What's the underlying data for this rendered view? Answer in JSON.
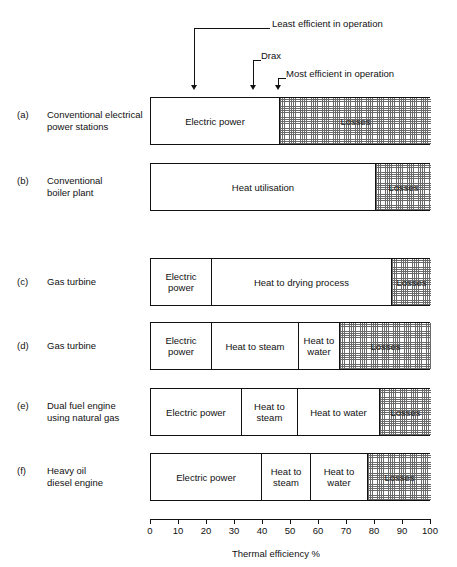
{
  "figure": {
    "axis": {
      "title": "Thermal efficiency %",
      "min": 0,
      "max": 100,
      "tick_step": 10,
      "tick_labels": [
        "0",
        "10",
        "20",
        "30",
        "40",
        "50",
        "60",
        "70",
        "80",
        "90",
        "100"
      ]
    },
    "annotations": [
      {
        "id": "least-efficient",
        "label": "Least efficient in operation",
        "value": 16
      },
      {
        "id": "drax",
        "label": "Drax",
        "value": 37
      },
      {
        "id": "most-efficient",
        "label": "Most efficient in operation",
        "value": 45.7
      }
    ],
    "rows": [
      {
        "letter": "(a)",
        "name_lines": [
          "Conventional electrical",
          "power stations"
        ],
        "segments": [
          {
            "label": "Electric power",
            "start": 0,
            "end": 45.7,
            "style": "plain"
          },
          {
            "label": "Losses",
            "start": 45.7,
            "end": 100,
            "style": "hatch"
          }
        ]
      },
      {
        "letter": "(b)",
        "name_lines": [
          "Conventional",
          "boiler plant"
        ],
        "segments": [
          {
            "label": "Heat utilisation",
            "start": 0,
            "end": 80,
            "style": "plain"
          },
          {
            "label": "Losses",
            "start": 80,
            "end": 100,
            "style": "hatch"
          }
        ]
      },
      {
        "letter": "(c)",
        "name_lines": [
          "Gas turbine"
        ],
        "segments": [
          {
            "label": "Electric power",
            "start": 0,
            "end": 21.4,
            "style": "plain"
          },
          {
            "label": "Heat to drying process",
            "start": 21.4,
            "end": 85.7,
            "style": "plain"
          },
          {
            "label": "Losses",
            "start": 85.7,
            "end": 100,
            "style": "hatch"
          }
        ]
      },
      {
        "letter": "(d)",
        "name_lines": [
          "Gas turbine"
        ],
        "segments": [
          {
            "label": "Electric power",
            "start": 0,
            "end": 21.4,
            "style": "plain"
          },
          {
            "label": "Heat to steam",
            "start": 21.4,
            "end": 52.5,
            "style": "plain"
          },
          {
            "label": "Heat to water",
            "start": 52.5,
            "end": 67.1,
            "style": "plain"
          },
          {
            "label": "Losses",
            "start": 67.1,
            "end": 100,
            "style": "hatch"
          }
        ]
      },
      {
        "letter": "(e)",
        "name_lines": [
          "Dual fuel engine",
          "using natural gas"
        ],
        "segments": [
          {
            "label": "Electric power",
            "start": 0,
            "end": 32.1,
            "style": "plain"
          },
          {
            "label": "Heat to steam",
            "start": 32.1,
            "end": 52.1,
            "style": "plain"
          },
          {
            "label": "Heat to water",
            "start": 52.1,
            "end": 81.4,
            "style": "plain"
          },
          {
            "label": "Losses",
            "start": 81.4,
            "end": 100,
            "style": "hatch"
          }
        ]
      },
      {
        "letter": "(f)",
        "name_lines": [
          "Heavy oil",
          "diesel engine"
        ],
        "segments": [
          {
            "label": "Electric power",
            "start": 0,
            "end": 39.3,
            "style": "plain"
          },
          {
            "label": "Heat to steam",
            "start": 39.3,
            "end": 56.8,
            "style": "plain"
          },
          {
            "label": "Heat to water",
            "start": 56.8,
            "end": 77.1,
            "style": "plain"
          },
          {
            "label": "Losses",
            "start": 77.1,
            "end": 100,
            "style": "hatch"
          }
        ]
      }
    ]
  },
  "chart_data": {
    "type": "bar",
    "title": "",
    "xlabel": "Thermal efficiency %",
    "ylabel": "",
    "xlim": [
      0,
      100
    ],
    "grid": false,
    "legend": "none",
    "orientation": "horizontal-stacked",
    "categories": [
      "(a) Conventional electrical power stations",
      "(b) Conventional boiler plant",
      "(c) Gas turbine",
      "(d) Gas turbine",
      "(e) Dual fuel engine using natural gas",
      "(f) Heavy oil diesel engine"
    ],
    "series": [
      {
        "name": "Electric power",
        "values": [
          45.7,
          0,
          21.4,
          21.4,
          32.1,
          39.3
        ]
      },
      {
        "name": "Heat utilisation",
        "values": [
          0,
          80,
          0,
          0,
          0,
          0
        ]
      },
      {
        "name": "Heat to drying process",
        "values": [
          0,
          0,
          64.3,
          0,
          0,
          0
        ]
      },
      {
        "name": "Heat to steam",
        "values": [
          0,
          0,
          0,
          31.1,
          20.0,
          17.5
        ]
      },
      {
        "name": "Heat to water",
        "values": [
          0,
          0,
          0,
          14.6,
          29.3,
          20.3
        ]
      },
      {
        "name": "Losses",
        "values": [
          54.3,
          20,
          14.3,
          32.9,
          18.6,
          22.9
        ]
      }
    ],
    "annotations": [
      {
        "label": "Least efficient in operation",
        "x": 16
      },
      {
        "label": "Drax",
        "x": 37
      },
      {
        "label": "Most efficient in operation",
        "x": 45.7
      }
    ]
  }
}
